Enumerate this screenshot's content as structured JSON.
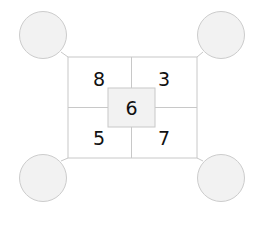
{
  "diagram": {
    "center_value": "6",
    "quadrants": {
      "top_left": "8",
      "top_right": "3",
      "bottom_left": "5",
      "bottom_right": "7"
    },
    "corner_circles": {
      "top_left": "",
      "top_right": "",
      "bottom_left": "",
      "bottom_right": ""
    },
    "colors": {
      "line": "#c8c8c8",
      "circle_fill": "#f2f2f2",
      "center_fill": "#f2f2f2",
      "text": "#111111"
    }
  }
}
